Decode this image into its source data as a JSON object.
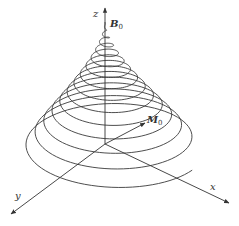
{
  "figure": {
    "axes": {
      "z_label": "z",
      "x_label": "x",
      "y_label": "y"
    },
    "field_label": {
      "main": "B",
      "subscript": "0"
    },
    "vector_label": {
      "main": "M",
      "subscript": "0"
    },
    "colors": {
      "line": "#3a3a3a",
      "background": "#ffffff"
    }
  }
}
